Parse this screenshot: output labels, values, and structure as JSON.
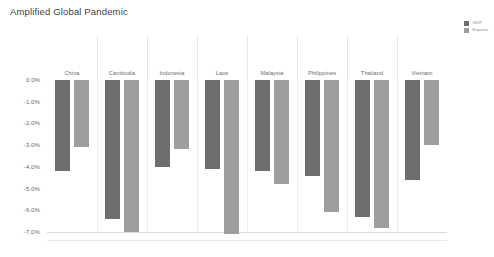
{
  "chart_data": {
    "type": "bar",
    "title": "Amplified Global Pandemic",
    "xlabel": "",
    "ylabel": "",
    "ylim": [
      -7.5,
      0.0
    ],
    "ytick_labels": [
      "0.0%",
      "-1.0%",
      "-2.0%",
      "-3.0%",
      "-4.0%",
      "-5.0%",
      "-6.0%",
      "-7.0%"
    ],
    "ytick_values": [
      0.0,
      -1.0,
      -2.0,
      -3.0,
      -4.0,
      -5.0,
      -6.0,
      -7.0
    ],
    "grid": false,
    "legend_position": "top-right",
    "categories": [
      "China",
      "Cambodia",
      "Indonesia",
      "Laos",
      "Malaysia",
      "Philippines",
      "Thailand",
      "Vietnam"
    ],
    "series": [
      {
        "name": "GDP",
        "color": "#6e6e6e",
        "values": [
          -4.2,
          -6.4,
          -4.0,
          -4.1,
          -4.2,
          -4.4,
          -6.3,
          -4.6
        ]
      },
      {
        "name": "Exports",
        "color": "#9e9e9e",
        "values": [
          -3.1,
          -7.0,
          -3.2,
          -7.1,
          -4.8,
          -6.1,
          -6.8,
          -3.0
        ]
      }
    ]
  },
  "legend": {
    "items": [
      {
        "label": "GDP",
        "color": "#6e6e6e"
      },
      {
        "label": "Exports",
        "color": "#9e9e9e"
      }
    ]
  }
}
